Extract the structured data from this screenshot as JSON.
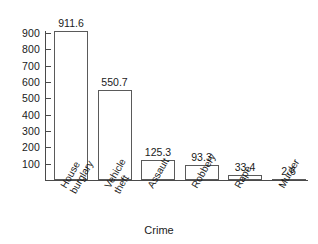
{
  "chart_data": {
    "type": "bar",
    "title": "",
    "subtitle": "",
    "xlabel": "Crime",
    "ylabel": "",
    "categories": [
      "House burglary",
      "Vehicle theft",
      "Assault",
      "Robbery",
      "Rape",
      "Murder"
    ],
    "values": [
      911.6,
      550.7,
      125.3,
      93.3,
      33.4,
      2.6
    ],
    "value_labels": [
      "911.6",
      "550.7",
      "125.3",
      "93.3",
      "33.4",
      "2.6"
    ],
    "ylim": [
      0,
      950
    ],
    "yticks": [
      100,
      200,
      300,
      400,
      500,
      600,
      700,
      800,
      900
    ],
    "ytick_labels": [
      "100",
      "200",
      "300",
      "400",
      "500",
      "600",
      "700",
      "800",
      "900"
    ],
    "grid": false,
    "legend": false,
    "legend_position": "none",
    "bar_fill": "#ffffff",
    "bar_edge": "#5a5a5a",
    "axis_color": "#4a4a4a",
    "background": "#ffffff",
    "category_label_rotation": -60
  },
  "axes": {
    "x_title": "Crime"
  }
}
